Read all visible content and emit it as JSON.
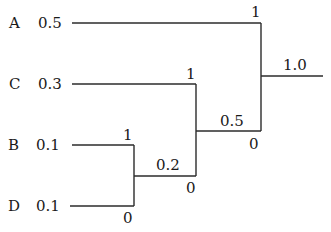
{
  "diagram": {
    "type": "huffman-tree",
    "leaves": [
      {
        "symbol": "A",
        "prob": "0.5"
      },
      {
        "symbol": "C",
        "prob": "0.3"
      },
      {
        "symbol": "B",
        "prob": "0.1"
      },
      {
        "symbol": "D",
        "prob": "0.1"
      }
    ],
    "merges": [
      {
        "children": [
          "B",
          "D"
        ],
        "sum": "0.2",
        "upper_bit": "1",
        "lower_bit": "0"
      },
      {
        "children": [
          "C",
          "0.2"
        ],
        "sum": "0.5",
        "upper_bit": "1",
        "lower_bit": "0"
      },
      {
        "children": [
          "A",
          "0.5"
        ],
        "sum": "1.0",
        "upper_bit": "1",
        "lower_bit": "0"
      }
    ]
  }
}
